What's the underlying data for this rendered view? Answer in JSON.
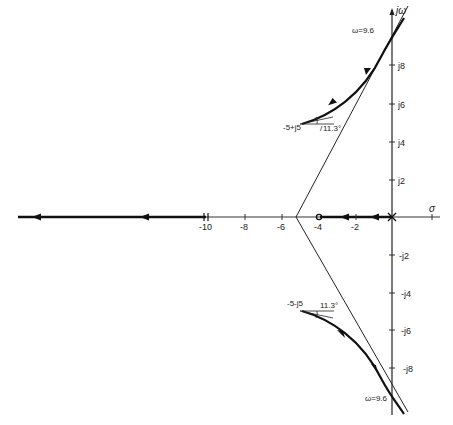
{
  "diagram": {
    "type": "root-locus",
    "axes": {
      "real_label": "σ",
      "imag_label": "jω",
      "real_ticks": [
        "-10",
        "-8",
        "-6",
        "-4",
        "-2"
      ],
      "imag_ticks_pos": [
        "j2",
        "j4",
        "j6",
        "j8"
      ],
      "imag_ticks_neg": [
        "-j2",
        "-j4",
        "-j6",
        "-j8"
      ]
    },
    "poles": [
      {
        "label": "-5 + j5",
        "angle_label": "11.3°",
        "angle_prefix": "/"
      },
      {
        "label": "-5 - j5",
        "angle_label": "11.3°",
        "angle_prefix": "\\"
      }
    ],
    "crossings": [
      {
        "label": "ω=9.6",
        "position": "upper"
      },
      {
        "label": "ω=9.6",
        "position": "lower"
      }
    ],
    "zero": {
      "real": -4
    },
    "asymptote_centroid": -5.2
  },
  "labels": {
    "upper_pole": "-5+j5",
    "upper_angle": "11.3°",
    "lower_pole": "-5-j5",
    "lower_angle": "11.3°",
    "upper_omega": "ω=9.6",
    "lower_omega": "ω=9.6",
    "sigma": "σ",
    "jw": "jω",
    "t_m10": "-10",
    "t_m8": "-8",
    "t_m6": "-6",
    "t_m4": "-4",
    "t_m2": "-2",
    "j2": "j2",
    "j4": "j4",
    "j6": "j6",
    "j8": "j8",
    "mj2": "-j2",
    "mj4": "-j4",
    "mj6": "-j6",
    "mj8": "-j8"
  }
}
